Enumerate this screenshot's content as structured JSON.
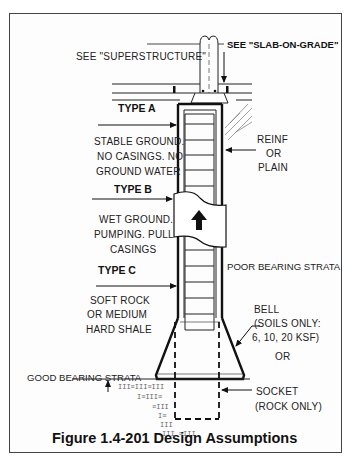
{
  "figure": {
    "caption": "Figure 1.4-201 Design Assumptions",
    "references": {
      "superstructure": "SEE \"SUPERSTRUCTURE\"",
      "slab_on_grade": "SEE \"SLAB-ON-GRADE\""
    },
    "types": [
      {
        "label": "TYPE A",
        "description": [
          "STABLE GROUND.",
          "NO CASINGS. NO",
          "GROUND WATER"
        ]
      },
      {
        "label": "TYPE B",
        "description": [
          "WET GROUND.",
          "PUMPING. PULL",
          "CASINGS"
        ]
      },
      {
        "label": "TYPE C",
        "description": [
          "SOFT ROCK",
          "OR MEDIUM",
          "HARD SHALE"
        ]
      }
    ],
    "annotations": {
      "reinforcement": [
        "REINF",
        "OR",
        "PLAIN"
      ],
      "poor_strata": "POOR BEARING STRATA",
      "bell": [
        "BELL",
        "(SOILS ONLY:",
        "6, 10, 20 KSF)"
      ],
      "or": "OR",
      "good_strata": "GOOD BEARING STRATA",
      "socket": [
        "SOCKET",
        "(ROCK ONLY)"
      ]
    },
    "colors": {
      "ink": "#111111",
      "background": "#fdfdfd"
    }
  }
}
